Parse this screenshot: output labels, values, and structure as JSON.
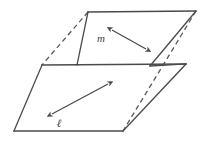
{
  "figure": {
    "name": "two-intersecting-planes-diagram",
    "background_color": "#ffffff",
    "stroke_color": "#4a4a4a",
    "hidden_edge_color": "#5a5a5a",
    "label_color": "#3d3d3d",
    "stroke_width": 1.3,
    "dash_pattern": "5,3.5"
  },
  "labels": {
    "line_m": "m",
    "line_l": "ℓ"
  },
  "geometry": {
    "upper_plane": {
      "name": "upper-back-plane",
      "vertices": [
        {
          "x": 88,
          "y": 12
        },
        {
          "x": 196,
          "y": 11
        },
        {
          "x": 150,
          "y": 66
        },
        {
          "x": 42,
          "y": 65
        }
      ]
    },
    "lower_plane": {
      "name": "lower-front-plane",
      "vertices": [
        {
          "x": 77,
          "y": 65
        },
        {
          "x": 186,
          "y": 64
        },
        {
          "x": 123,
          "y": 131
        },
        {
          "x": 14,
          "y": 131
        }
      ]
    },
    "intersection_line": {
      "name": "plane-intersection-line",
      "from": {
        "x": 42,
        "y": 65
      },
      "to": {
        "x": 186,
        "y": 64
      }
    },
    "solid_edges": [
      {
        "name": "upper-top-edge",
        "x1": 88,
        "y1": 12,
        "x2": 196,
        "y2": 11
      },
      {
        "name": "upper-left-front-edge",
        "x1": 88,
        "y1": 12,
        "x2": 77,
        "y2": 65
      },
      {
        "name": "upper-right-edge",
        "x1": 196,
        "y1": 11,
        "x2": 150,
        "y2": 66
      },
      {
        "name": "front-bottom-edge",
        "x1": 14,
        "y1": 131,
        "x2": 123,
        "y2": 131
      },
      {
        "name": "front-left-edge",
        "x1": 42,
        "y1": 65,
        "x2": 14,
        "y2": 131
      },
      {
        "name": "front-right-edge",
        "x1": 186,
        "y1": 64,
        "x2": 123,
        "y2": 131
      },
      {
        "name": "intersection-edge",
        "x1": 42,
        "y1": 65,
        "x2": 186,
        "y2": 64
      },
      {
        "name": "lower-plane-back-edge",
        "x1": 150,
        "y1": 66,
        "x2": 186,
        "y2": 64
      }
    ],
    "dashed_edges": [
      {
        "name": "upper-hidden-left-edge",
        "x1": 88,
        "y1": 12,
        "x2": 42,
        "y2": 65
      },
      {
        "name": "hidden-diagonal-edge",
        "x1": 196,
        "y1": 11,
        "x2": 123,
        "y2": 131
      }
    ]
  },
  "vectors": [
    {
      "name": "line-m-vector",
      "label": "m",
      "double_headed": true,
      "x1": 112,
      "y1": 30,
      "x2": 146,
      "y2": 49,
      "label_x": 101,
      "label_y": 42,
      "label_size": 11
    },
    {
      "name": "line-l-vector",
      "label": "ℓ",
      "double_headed": true,
      "x1": 52,
      "y1": 114,
      "x2": 108,
      "y2": 84,
      "label_x": 59,
      "label_y": 127,
      "label_size": 11
    }
  ]
}
